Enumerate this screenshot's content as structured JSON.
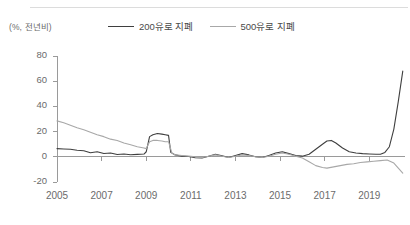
{
  "figure": {
    "unit_label": "(%, 전년비)"
  },
  "legend": {
    "position": "top-center",
    "items": [
      {
        "label": "200유로 지폐",
        "color": "#3f3f3f"
      },
      {
        "label": "500유로 지폐",
        "color": "#a8a8a8"
      }
    ]
  },
  "chart_data": {
    "type": "line",
    "title": "",
    "subtitle": "",
    "xlabel": "",
    "ylabel": "(%, 전년비)",
    "xlim": [
      2005.0,
      2020.6
    ],
    "ylim": [
      -20,
      80
    ],
    "yticks": [
      -20,
      0,
      20,
      40,
      60,
      80
    ],
    "xticks": [
      2005,
      2007,
      2009,
      2011,
      2013,
      2015,
      2017,
      2019
    ],
    "ytick_labels": [
      "-20",
      "0",
      "20",
      "40",
      "60",
      "80"
    ],
    "xtick_labels": [
      "2005",
      "2007",
      "2009",
      "2011",
      "2013",
      "2015",
      "2017",
      "2019"
    ],
    "grid": false,
    "zero_line": true,
    "legend_position": "top-center",
    "series": [
      {
        "name": "200유로 지폐",
        "color": "#3f3f3f",
        "x": [
          2005.0,
          2005.3,
          2005.6,
          2005.9,
          2006.2,
          2006.5,
          2006.8,
          2007.1,
          2007.4,
          2007.7,
          2008.0,
          2008.3,
          2008.6,
          2008.9,
          2009.0,
          2009.15,
          2009.3,
          2009.5,
          2009.7,
          2009.85,
          2010.0,
          2010.1,
          2010.3,
          2010.6,
          2010.9,
          2011.2,
          2011.5,
          2011.8,
          2012.1,
          2012.4,
          2012.7,
          2013.0,
          2013.3,
          2013.6,
          2013.9,
          2014.2,
          2014.5,
          2014.8,
          2015.1,
          2015.4,
          2015.7,
          2016.0,
          2016.3,
          2016.6,
          2016.9,
          2017.1,
          2017.3,
          2017.5,
          2017.8,
          2018.1,
          2018.4,
          2018.7,
          2019.0,
          2019.3,
          2019.5,
          2019.7,
          2019.9,
          2020.1,
          2020.3,
          2020.5
        ],
        "y": [
          6.5,
          6.2,
          6.0,
          5.2,
          4.8,
          3.2,
          4.0,
          2.6,
          3.0,
          1.8,
          2.2,
          1.6,
          1.9,
          2.2,
          4.0,
          16.0,
          17.5,
          18.5,
          18.0,
          17.5,
          17.0,
          3.5,
          1.5,
          0.5,
          0.2,
          -0.8,
          -1.0,
          0.5,
          2.0,
          0.8,
          -0.5,
          1.0,
          2.5,
          1.5,
          0.0,
          -0.5,
          1.0,
          3.0,
          4.0,
          2.5,
          1.0,
          0.5,
          2.0,
          6.0,
          10.0,
          12.5,
          13.0,
          11.0,
          7.0,
          4.0,
          3.0,
          2.5,
          2.2,
          2.0,
          2.0,
          3.5,
          8.0,
          22.0,
          44.0,
          68.0
        ]
      },
      {
        "name": "500유로 지폐",
        "color": "#a8a8a8",
        "x": [
          2005.0,
          2005.3,
          2005.6,
          2005.9,
          2006.2,
          2006.5,
          2006.8,
          2007.1,
          2007.4,
          2007.7,
          2008.0,
          2008.3,
          2008.6,
          2008.9,
          2009.0,
          2009.15,
          2009.3,
          2009.5,
          2009.7,
          2009.85,
          2010.0,
          2010.15,
          2010.3,
          2010.6,
          2010.9,
          2011.2,
          2011.5,
          2011.8,
          2012.1,
          2012.4,
          2012.7,
          2013.0,
          2013.3,
          2013.6,
          2013.9,
          2014.2,
          2014.5,
          2014.8,
          2015.1,
          2015.4,
          2015.7,
          2016.0,
          2016.3,
          2016.6,
          2016.9,
          2017.1,
          2017.4,
          2017.7,
          2018.0,
          2018.3,
          2018.6,
          2018.9,
          2019.2,
          2019.5,
          2019.8,
          2020.1,
          2020.3,
          2020.5
        ],
        "y": [
          28.5,
          27.0,
          25.0,
          23.0,
          21.5,
          19.5,
          17.5,
          16.0,
          14.0,
          13.0,
          11.0,
          9.5,
          8.0,
          7.0,
          6.5,
          12.0,
          13.0,
          13.0,
          12.5,
          12.0,
          12.0,
          3.0,
          1.5,
          1.0,
          0.5,
          0.0,
          -0.5,
          0.5,
          1.5,
          0.5,
          -0.5,
          0.5,
          1.5,
          1.0,
          0.0,
          -0.5,
          0.5,
          2.0,
          3.0,
          2.0,
          0.5,
          -1.0,
          -4.0,
          -7.0,
          -8.5,
          -9.0,
          -8.0,
          -7.0,
          -6.0,
          -5.5,
          -4.5,
          -4.0,
          -3.5,
          -3.0,
          -2.5,
          -5.0,
          -9.0,
          -13.0
        ]
      }
    ]
  }
}
